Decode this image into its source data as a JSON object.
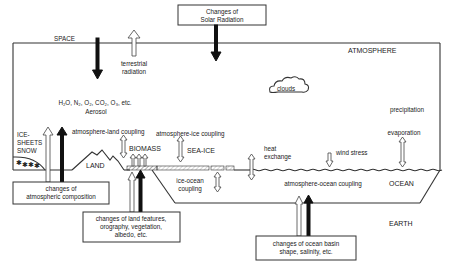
{
  "diagram": {
    "regions": {
      "space": "SPACE",
      "atmosphere": "ATMOSPHERE",
      "earth": "EARTH",
      "ocean": "OCEAN",
      "land": "LAND",
      "sea_ice": "SEA-ICE",
      "biomass": "BIOMASS",
      "ice_sheets": [
        "ICE-",
        "SHEETS",
        "SNOW"
      ]
    },
    "external_boxes": {
      "solar": [
        "Changes of",
        "Solar Radiation"
      ],
      "atmospheric_composition": [
        "changes of",
        "atmospheric composition"
      ],
      "land_features": [
        "changes of land features,",
        "orography, vegetation,",
        "albedo, etc."
      ],
      "ocean_basin": [
        "changes of ocean basin",
        "shape, salinity, etc."
      ]
    },
    "labels": {
      "terrestrial_radiation": [
        "terrestrial",
        "radiation"
      ],
      "composition": "H₂O, N₂, O₂, CO₂, O₃, etc.",
      "aerosol": "Aerosol",
      "clouds": "clouds",
      "precipitation": "precipitation",
      "evaporation": "evaporation",
      "atmosphere_land_coupling": "atmosphere-land coupling",
      "atmosphere_ice_coupling": "atmosphere-ice coupling",
      "heat_exchange": [
        "heat",
        "exchange"
      ],
      "wind_stress": "wind stress",
      "ice_ocean_coupling": [
        "ice-ocean",
        "coupling"
      ],
      "atmosphere_ocean_coupling": "atmosphere-ocean coupling"
    }
  }
}
